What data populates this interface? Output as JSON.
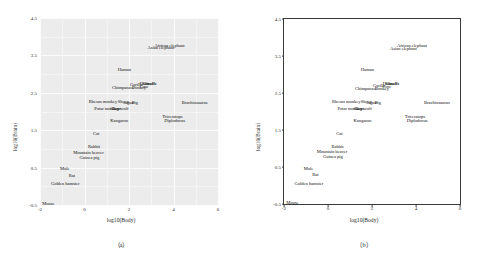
{
  "figure": {
    "panels": [
      {
        "key": "a",
        "caption": "（a）",
        "style": "gray-background-with-white-grid"
      },
      {
        "key": "b",
        "caption": "（b）",
        "style": "white-background-with-black-frame"
      }
    ]
  },
  "chart_data": {
    "type": "scatter",
    "title": "",
    "xlabel": "log10(Body)",
    "ylabel": "log10(Brain)",
    "xlim": [
      -2,
      6
    ],
    "ylim": [
      -0.5,
      4.5
    ],
    "xticks": [
      -2,
      0,
      2,
      4,
      6
    ],
    "yticks": [
      -0.5,
      0.5,
      1.5,
      2.5,
      3.5,
      4.5
    ],
    "grid": true,
    "legend": "none",
    "point_marker": "text-label",
    "points": [
      {
        "label": "African elephant",
        "x": 3.82,
        "y": 3.76,
        "bold": false
      },
      {
        "label": "Asian elephant",
        "x": 3.43,
        "y": 3.69,
        "bold": false
      },
      {
        "label": "Human",
        "x": 1.79,
        "y": 3.12,
        "bold": false
      },
      {
        "label": "Giraffe",
        "x": 2.93,
        "y": 2.74,
        "bold": true
      },
      {
        "label": "Horse",
        "x": 2.73,
        "y": 2.73,
        "bold": false
      },
      {
        "label": "Cow",
        "x": 2.67,
        "y": 2.65,
        "bold": false
      },
      {
        "label": "Chimpanzee",
        "x": 1.74,
        "y": 2.62,
        "bold": false
      },
      {
        "label": "Donkey",
        "x": 2.45,
        "y": 2.62,
        "bold": false
      },
      {
        "label": "Gorilla",
        "x": 2.32,
        "y": 2.7,
        "bold": false
      },
      {
        "label": "Rhesus monkey",
        "x": 0.83,
        "y": 2.26,
        "bold": false
      },
      {
        "label": "Sheep",
        "x": 1.74,
        "y": 2.25,
        "bold": false
      },
      {
        "label": "Pig",
        "x": 2.26,
        "y": 2.23,
        "bold": false
      },
      {
        "label": "Jaguar",
        "x": 2.0,
        "y": 2.24,
        "bold": false
      },
      {
        "label": "Potar monkey",
        "x": 1.0,
        "y": 2.08,
        "bold": false
      },
      {
        "label": "Goat",
        "x": 1.44,
        "y": 2.07,
        "bold": false
      },
      {
        "label": "Grey wolf",
        "x": 1.57,
        "y": 2.08,
        "bold": false
      },
      {
        "label": "Kangaroo",
        "x": 1.56,
        "y": 1.75,
        "bold": false
      },
      {
        "label": "Brachiosaurus",
        "x": 4.95,
        "y": 2.23,
        "bold": false
      },
      {
        "label": "Triceratops",
        "x": 3.95,
        "y": 1.85,
        "bold": false
      },
      {
        "label": "Diplodocus",
        "x": 4.05,
        "y": 1.74,
        "bold": false
      },
      {
        "label": "Cat",
        "x": 0.52,
        "y": 1.4,
        "bold": false
      },
      {
        "label": "Rabbit",
        "x": 0.43,
        "y": 1.04,
        "bold": false
      },
      {
        "label": "Mountain beaver",
        "x": 0.18,
        "y": 0.9,
        "bold": false
      },
      {
        "label": "Guinea pig",
        "x": 0.22,
        "y": 0.76,
        "bold": false
      },
      {
        "label": "Mole",
        "x": -0.89,
        "y": 0.45,
        "bold": false
      },
      {
        "label": "Rat",
        "x": -0.57,
        "y": 0.28,
        "bold": false
      },
      {
        "label": "Golden hamster",
        "x": -0.87,
        "y": 0.05,
        "bold": false
      },
      {
        "label": "Mouse",
        "x": -1.62,
        "y": -0.46,
        "bold": false
      }
    ]
  }
}
